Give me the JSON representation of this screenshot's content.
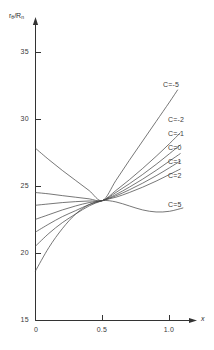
{
  "chart_data": {
    "type": "line",
    "title": "",
    "subtitle": "",
    "xlabel": "x",
    "ylabel": "rθ/Rₙ",
    "ylabel_parts": {
      "base": "r",
      "sub1": "θ",
      "slash": "/R",
      "sub2": "n"
    },
    "xlim": [
      0.0,
      1.18
    ],
    "ylim": [
      15,
      36.5
    ],
    "xticks": [
      0,
      0.5,
      1.0
    ],
    "xtick_labels": [
      "0",
      "0.5",
      "1.0"
    ],
    "yticks": [
      15,
      20,
      25,
      30,
      35
    ],
    "ytick_labels": [
      "15",
      "20",
      "25",
      "30",
      "35"
    ],
    "grid": false,
    "legend_position": "right-inline",
    "axis_arrows": true,
    "convergence_point": {
      "x": 0.5,
      "y": 23.95
    },
    "series": [
      {
        "name": "C=-5",
        "label": "C=-5",
        "color": "#4a4a4a",
        "x": [
          0.0,
          0.1,
          0.2,
          0.3,
          0.4,
          0.5,
          0.6,
          0.7,
          0.8,
          0.9,
          1.0,
          1.06
        ],
        "values": [
          27.85,
          27.0,
          26.2,
          25.45,
          24.7,
          23.95,
          25.45,
          26.95,
          28.4,
          29.85,
          31.3,
          32.2
        ]
      },
      {
        "name": "C=-2",
        "label": "C=-2",
        "color": "#4a4a4a",
        "x": [
          0.0,
          0.1,
          0.2,
          0.3,
          0.4,
          0.5,
          0.6,
          0.7,
          0.8,
          0.9,
          1.0,
          1.08
        ],
        "values": [
          24.55,
          24.45,
          24.32,
          24.2,
          24.08,
          23.95,
          24.7,
          25.5,
          26.35,
          27.25,
          28.2,
          29.0
        ]
      },
      {
        "name": "C=-1",
        "label": "C=-1",
        "color": "#4a4a4a",
        "x": [
          0.0,
          0.1,
          0.2,
          0.3,
          0.4,
          0.5,
          0.6,
          0.7,
          0.8,
          0.9,
          1.0,
          1.08
        ],
        "values": [
          23.6,
          23.7,
          23.8,
          23.87,
          23.92,
          23.95,
          24.55,
          25.2,
          25.9,
          26.65,
          27.45,
          28.1
        ]
      },
      {
        "name": "C=0",
        "label": "C=0",
        "color": "#4a4a4a",
        "x": [
          0.0,
          0.1,
          0.2,
          0.3,
          0.4,
          0.5,
          0.6,
          0.7,
          0.8,
          0.9,
          1.0,
          1.08
        ],
        "values": [
          22.55,
          22.9,
          23.25,
          23.55,
          23.8,
          23.95,
          24.4,
          24.95,
          25.55,
          26.2,
          26.9,
          27.45
        ]
      },
      {
        "name": "C=1",
        "label": "C=1",
        "color": "#4a4a4a",
        "x": [
          0.0,
          0.1,
          0.2,
          0.3,
          0.4,
          0.5,
          0.6,
          0.7,
          0.8,
          0.9,
          1.0,
          1.08
        ],
        "values": [
          21.6,
          22.2,
          22.75,
          23.2,
          23.65,
          23.95,
          24.3,
          24.75,
          25.25,
          25.8,
          26.4,
          26.9
        ]
      },
      {
        "name": "C=2",
        "label": "C=2",
        "color": "#4a4a4a",
        "x": [
          0.0,
          0.1,
          0.2,
          0.3,
          0.4,
          0.5,
          0.6,
          0.7,
          0.8,
          0.9,
          1.0,
          1.08
        ],
        "values": [
          20.55,
          21.5,
          22.3,
          22.95,
          23.55,
          23.95,
          24.2,
          24.55,
          24.95,
          25.4,
          25.9,
          26.3
        ]
      },
      {
        "name": "C=5",
        "label": "C=5",
        "color": "#4a4a4a",
        "x": [
          0.0,
          0.1,
          0.2,
          0.3,
          0.4,
          0.5,
          0.6,
          0.7,
          0.8,
          0.9,
          1.0,
          1.1
        ],
        "values": [
          18.7,
          20.45,
          21.85,
          22.95,
          23.65,
          23.95,
          23.85,
          23.55,
          23.25,
          23.1,
          23.15,
          23.4
        ]
      }
    ],
    "legend_labels": [
      {
        "text": "C=-5",
        "left": 163,
        "top": 81
      },
      {
        "text": "C=-2",
        "left": 168,
        "top": 116
      },
      {
        "text": "C=-1",
        "left": 168,
        "top": 130
      },
      {
        "text": "C=0",
        "left": 168,
        "top": 144
      },
      {
        "text": "C=1",
        "left": 168,
        "top": 158
      },
      {
        "text": "C=2",
        "left": 168,
        "top": 172
      },
      {
        "text": "C=5",
        "left": 168,
        "top": 201
      }
    ]
  }
}
